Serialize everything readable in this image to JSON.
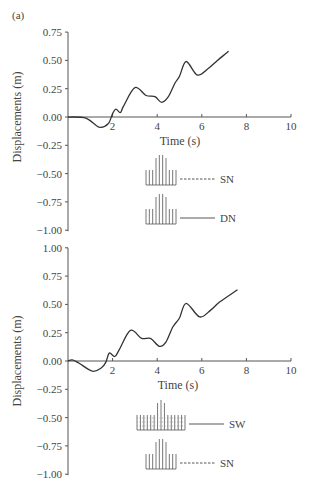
{
  "panel_label": "(a)",
  "chart_data": [
    {
      "type": "line",
      "title": "",
      "xlabel": "Time (s)",
      "ylabel": "Displacements (m)",
      "xlim": [
        0,
        10
      ],
      "ylim": [
        -1.0,
        0.75
      ],
      "x_ticks": [
        "2",
        "4",
        "6",
        "8",
        "10"
      ],
      "y_ticks": [
        "0.75",
        "0.50",
        "0.25",
        "0.00",
        "-0.25",
        "-0.50",
        "-0.75",
        "-1.00"
      ],
      "grid": false,
      "legend_position": "lower center",
      "legend": [
        {
          "name": "SN",
          "style": "dashed"
        },
        {
          "name": "DN",
          "style": "solid"
        }
      ],
      "series": [
        {
          "name": "SN / DN (overlapping)",
          "x": [
            0,
            0.8,
            1.4,
            1.8,
            2.0,
            2.15,
            2.35,
            2.5,
            3.0,
            3.5,
            3.9,
            4.2,
            4.5,
            4.8,
            5.0,
            5.3,
            5.8,
            6.3,
            6.7,
            7.2
          ],
          "y": [
            0,
            -0.01,
            -0.09,
            -0.06,
            0.03,
            0.07,
            0.04,
            0.1,
            0.26,
            0.19,
            0.18,
            0.13,
            0.18,
            0.3,
            0.36,
            0.49,
            0.37,
            0.43,
            0.5,
            0.58
          ]
        }
      ]
    },
    {
      "type": "line",
      "title": "",
      "xlabel": "Time (s)",
      "ylabel": "Displacements (m)",
      "xlim": [
        0,
        10
      ],
      "ylim": [
        -1.0,
        1.0
      ],
      "x_ticks": [
        "2",
        "4",
        "6",
        "8",
        "10"
      ],
      "y_ticks": [
        "1.00",
        "0.75",
        "0.50",
        "0.25",
        "0.00",
        "-0.25",
        "-0.50",
        "-0.75",
        "-1.00"
      ],
      "grid": false,
      "legend_position": "lower center",
      "legend": [
        {
          "name": "SW",
          "style": "solid"
        },
        {
          "name": "SN",
          "style": "dashed"
        }
      ],
      "series": [
        {
          "name": "SW / SN (overlapping)",
          "x": [
            0,
            0.2,
            0.5,
            1.1,
            1.5,
            1.7,
            1.85,
            2.1,
            2.3,
            2.8,
            3.3,
            3.7,
            4.1,
            4.4,
            4.7,
            5.0,
            5.3,
            5.9,
            6.4,
            6.8,
            7.6
          ],
          "y": [
            0,
            0.01,
            -0.02,
            -0.09,
            -0.06,
            -0.01,
            0.07,
            0.04,
            0.1,
            0.27,
            0.2,
            0.2,
            0.13,
            0.17,
            0.3,
            0.38,
            0.51,
            0.39,
            0.45,
            0.52,
            0.63
          ]
        }
      ]
    }
  ]
}
